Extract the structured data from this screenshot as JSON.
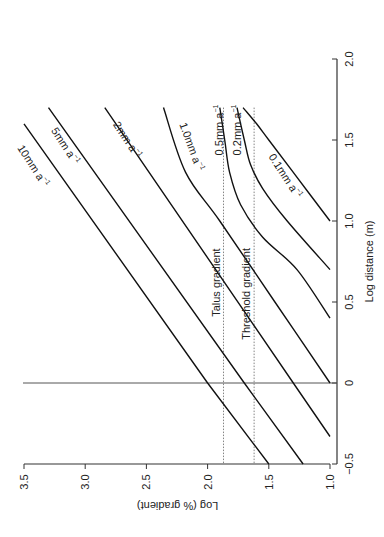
{
  "chart_data": {
    "type": "line",
    "orientation": "rotated 90 degrees counter-clockwise",
    "title": "",
    "xlabel": "Log distance (m)",
    "ylabel": "Log (% gradient)",
    "xlim": [
      -0.5,
      2.0
    ],
    "ylim": [
      1.0,
      3.5
    ],
    "xticks": [
      "−0.5",
      "0",
      "0.5",
      "1.0",
      "1.5",
      "2.0"
    ],
    "yticks": [
      "1.0",
      "1.5",
      "2.0",
      "2.5",
      "3.0",
      "3.5"
    ],
    "grid": false,
    "reference_lines": [
      {
        "name": "x-zero-line",
        "axis": "x",
        "value": 0,
        "style": "solid"
      },
      {
        "name": "Talus gradient",
        "axis": "y",
        "value": 1.87,
        "style": "dotted",
        "label": "Talus gradient"
      },
      {
        "name": "Threshold gradient",
        "axis": "y",
        "value": 1.62,
        "style": "dotted",
        "label": "Threshold gradient"
      }
    ],
    "series": [
      {
        "name": "10mm a⁻¹",
        "label": "10mm a",
        "points": [
          [
            -0.5,
            1.5
          ],
          [
            0,
            2.0
          ],
          [
            1.6,
            3.5
          ]
        ]
      },
      {
        "name": "5mm a⁻¹",
        "label": "5mm a",
        "points": [
          [
            -0.5,
            1.22
          ],
          [
            0,
            1.7
          ],
          [
            1.7,
            3.3
          ]
        ]
      },
      {
        "name": "2mm a⁻¹",
        "label": "2mm a",
        "points": [
          [
            -0.33,
            1.0
          ],
          [
            0,
            1.3
          ],
          [
            1.7,
            2.84
          ]
        ]
      },
      {
        "name": "1.0mm a⁻¹",
        "label": "1.0mm a",
        "points": [
          [
            0,
            1.0
          ],
          [
            0.5,
            1.45
          ],
          [
            1.0,
            1.9
          ],
          [
            1.3,
            2.18
          ],
          [
            1.7,
            2.36
          ]
        ]
      },
      {
        "name": "0.5mm a⁻¹",
        "label": "0.5mm a",
        "points": [
          [
            0.4,
            1.0
          ],
          [
            0.7,
            1.27
          ],
          [
            0.9,
            1.55
          ],
          [
            1.1,
            1.73
          ],
          [
            1.3,
            1.82
          ],
          [
            1.5,
            1.86
          ],
          [
            1.7,
            1.9
          ]
        ]
      },
      {
        "name": "0.2mm a⁻¹",
        "label": "0.2mm a",
        "points": [
          [
            0.7,
            1.0
          ],
          [
            1.0,
            1.35
          ],
          [
            1.2,
            1.55
          ],
          [
            1.35,
            1.65
          ],
          [
            1.5,
            1.7
          ],
          [
            1.7,
            1.76
          ]
        ]
      },
      {
        "name": "0.1mm a⁻¹",
        "label": "0.1mm a",
        "points": [
          [
            1.0,
            1.0
          ],
          [
            1.3,
            1.3
          ],
          [
            1.5,
            1.5
          ],
          [
            1.6,
            1.6
          ],
          [
            1.7,
            1.71
          ]
        ]
      }
    ]
  }
}
